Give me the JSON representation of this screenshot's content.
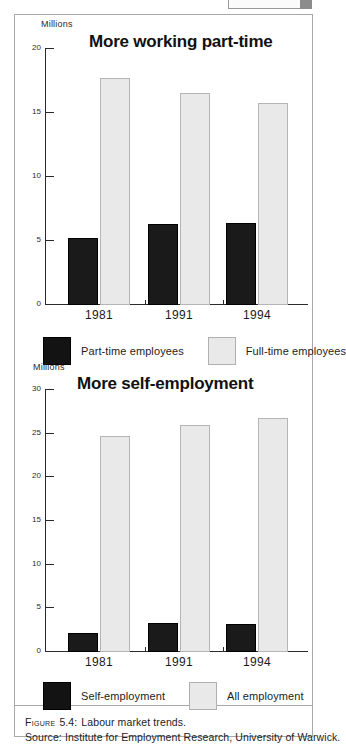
{
  "figure": {
    "caption_prefix": "Figure",
    "caption_number": "5.4:",
    "caption_text": "Labour market trends.",
    "source_line": "Source: Institute for Employment Research, University of Warwick."
  },
  "legends": [
    {
      "items": [
        {
          "label": "Part-time employees",
          "swatch": "dark-swatch",
          "color": "#131313"
        },
        {
          "label": "Full-time employees",
          "swatch": "light-swatch",
          "color": "#e9e9e9"
        }
      ]
    },
    {
      "items": [
        {
          "label": "Self-employment",
          "swatch": "dark-swatch",
          "color": "#131313"
        },
        {
          "label": "All employment",
          "swatch": "light-swatch",
          "color": "#e9e9e9"
        }
      ]
    }
  ],
  "chart_data": [
    {
      "type": "bar",
      "title": "More working part-time",
      "xlabel": "",
      "ylabel": "Millions",
      "unit_label": "Millions",
      "categories": [
        "1981",
        "1991",
        "1994"
      ],
      "ylim": [
        0,
        20
      ],
      "yticks": [
        0,
        5,
        10,
        15,
        20
      ],
      "ytick_labels": [
        "0",
        "5",
        "10",
        "15",
        "20"
      ],
      "grid": false,
      "legend_position": "below",
      "series": [
        {
          "name": "Part-time employees",
          "color": "#131313",
          "values": [
            5.2,
            6.3,
            6.4
          ]
        },
        {
          "name": "Full-time employees",
          "color": "#e9e9e9",
          "values": [
            17.7,
            16.6,
            15.8
          ]
        }
      ]
    },
    {
      "type": "bar",
      "title": "More self-employment",
      "xlabel": "",
      "ylabel": "Millions",
      "unit_label": "Millions",
      "categories": [
        "1981",
        "1991",
        "1994"
      ],
      "ylim": [
        0,
        30
      ],
      "yticks": [
        0,
        5,
        10,
        15,
        20,
        25,
        30
      ],
      "ytick_labels": [
        "0",
        "5",
        "10",
        "15",
        "20",
        "25",
        "30"
      ],
      "grid": false,
      "legend_position": "below",
      "series": [
        {
          "name": "Self-employment",
          "color": "#131313",
          "values": [
            2.2,
            3.3,
            3.2
          ]
        },
        {
          "name": "All employment",
          "color": "#e9e9e9",
          "values": [
            24.7,
            26.0,
            26.8
          ]
        }
      ]
    }
  ]
}
